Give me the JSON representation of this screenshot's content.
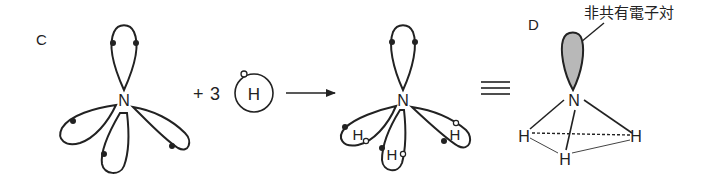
{
  "panels": {
    "c": {
      "label": "C",
      "center_atom": "N",
      "description": "Nitrogen atom with four sp3 hybrid orbitals; one lone pair (2 electrons) and three singly-occupied orbitals"
    },
    "reaction": {
      "plus": "+",
      "coefficient": "3",
      "hydrogen_atom": "H",
      "arrow": "→"
    },
    "product": {
      "center_atom": "N",
      "hydrogens": [
        "H",
        "H",
        "H"
      ],
      "description": "NH3 formed by overlap of N sp3 orbitals with H 1s orbitals"
    },
    "equivalence": {
      "symbol": "≡"
    },
    "d": {
      "label": "D",
      "center_atom": "N",
      "hydrogens": [
        "H",
        "H",
        "H"
      ],
      "callout": "非共有電子対",
      "description": "Trigonal pyramidal ammonia with shaded lone-pair lobe"
    }
  },
  "colors": {
    "line": "#222222",
    "lone_pair_fill": "#b8b8b8",
    "background": "#ffffff"
  }
}
